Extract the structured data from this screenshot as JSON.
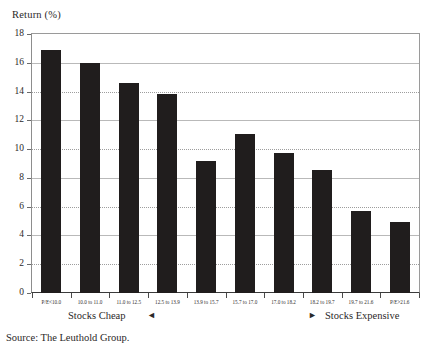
{
  "chart_data": {
    "type": "bar",
    "title": "Return (%)",
    "xlabel": "",
    "ylabel": "Return (%)",
    "ylim": [
      0,
      18
    ],
    "ytick_step": 2,
    "yticks": [
      0,
      2,
      4,
      6,
      8,
      10,
      12,
      14,
      16,
      18
    ],
    "grid": true,
    "legend": "none",
    "bar_color": "#201d1d",
    "categories": [
      "P/E<10.0",
      "10.0 to 11.0",
      "11.0 to 12.5",
      "12.5 to 13.9",
      "13.9 to 15.7",
      "15.7 to 17.0",
      "17.0 to 18.2",
      "18.2 to 19.7",
      "19.7 to 21.6",
      "P/E>21.6"
    ],
    "values": [
      16.9,
      16.0,
      14.6,
      13.85,
      9.15,
      11.05,
      9.75,
      8.55,
      5.7,
      4.95
    ],
    "annotations": [
      "Stocks Cheap",
      "Stocks Expensive"
    ]
  },
  "axis": {
    "y_title": "Return (%)"
  },
  "annotations": {
    "cheap_label": "Stocks Cheap",
    "cheap_arrow": "◄",
    "expensive_arrow": "►",
    "expensive_label": "Stocks Expensive"
  },
  "footer": {
    "source": "Source: The Leuthold Group."
  }
}
